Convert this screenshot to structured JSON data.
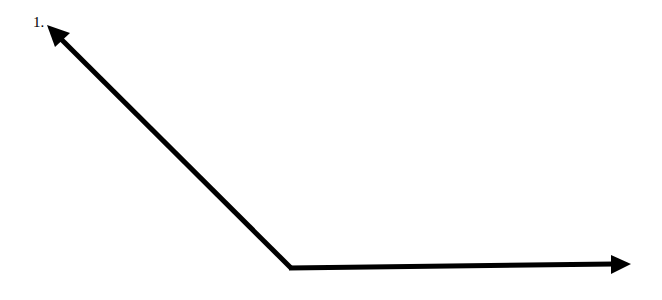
{
  "diagram": {
    "label": "1.",
    "type": "angle",
    "vertex": [
      291,
      268
    ],
    "rays": [
      {
        "name": "upper-left-ray",
        "end": [
          47,
          26
        ]
      },
      {
        "name": "right-ray",
        "end": [
          630,
          264
        ]
      }
    ],
    "stroke_color": "#000000"
  }
}
